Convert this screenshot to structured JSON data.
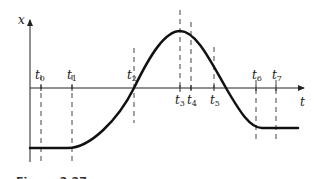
{
  "figure": {
    "caption": "Figure 2.27",
    "axes": {
      "vertical_label": "x",
      "horizontal_label": "t"
    },
    "time_marks": [
      {
        "name": "t",
        "sub": "0",
        "x": 41,
        "label_pos": "above"
      },
      {
        "name": "t",
        "sub": "1",
        "x": 72,
        "label_pos": "above"
      },
      {
        "name": "t",
        "sub": "2",
        "x": 134,
        "label_pos": "above"
      },
      {
        "name": "t",
        "sub": "3",
        "x": 180,
        "label_pos": "below"
      },
      {
        "name": "t",
        "sub": "4",
        "x": 191,
        "label_pos": "below"
      },
      {
        "name": "t",
        "sub": "5",
        "x": 214,
        "label_pos": "below"
      },
      {
        "name": "t",
        "sub": "6",
        "x": 256,
        "label_pos": "above"
      },
      {
        "name": "t",
        "sub": "7",
        "x": 276,
        "label_pos": "above"
      }
    ],
    "curve_description": "Position x(t): constant negative from start to t1, increases (concave up) through zero at t2, reaches maximum at t3, decreases through zero after t5, levels off to a constant negative value near t6 and stays constant past t7",
    "colors": {
      "curve": "#111111",
      "axes": "#222222",
      "dashed": "#444444"
    }
  }
}
